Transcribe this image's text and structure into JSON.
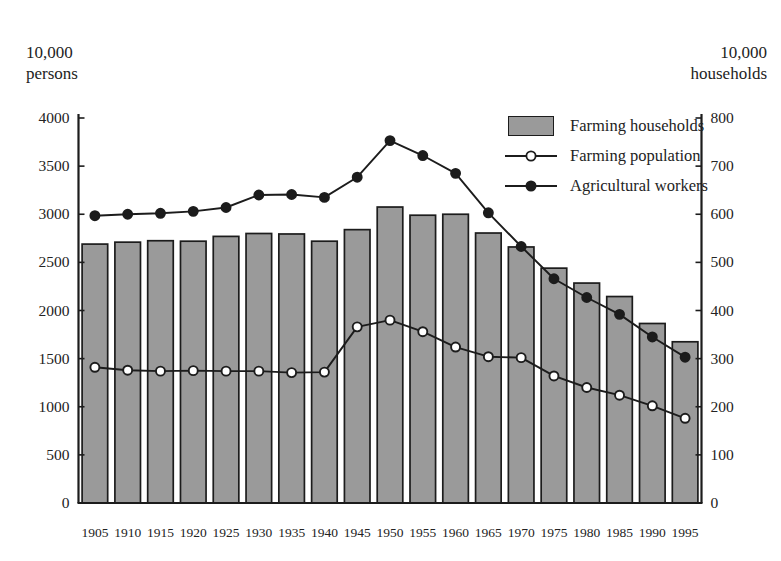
{
  "chart_data": {
    "type": "bar",
    "title": "",
    "subtitle": "",
    "xlabel": "",
    "ylabel": "10,000 persons",
    "y2label": "10,000 households",
    "grid": false,
    "legend_position": "top-right inside plot",
    "categories": [
      "1905",
      "1910",
      "1915",
      "1920",
      "1925",
      "1930",
      "1935",
      "1940",
      "1945",
      "1950",
      "1955",
      "1960",
      "1965",
      "1970",
      "1975",
      "1980",
      "1985",
      "1990",
      "1995"
    ],
    "axes": {
      "left": {
        "label": "10,000 persons",
        "min": 0,
        "max": 4000,
        "step": 500,
        "ticks": [
          "0",
          "500",
          "1000",
          "1500",
          "2000",
          "2500",
          "3000",
          "3500",
          "4000"
        ]
      },
      "right": {
        "label": "10,000 households",
        "min": 0,
        "max": 800,
        "step": 100,
        "ticks": [
          "0",
          "100",
          "200",
          "300",
          "400",
          "500",
          "600",
          "700",
          "800"
        ]
      },
      "x": {
        "ticks": [
          "1905",
          "1910",
          "1915",
          "1920",
          "1925",
          "1930",
          "1935",
          "1940",
          "1945",
          "1950",
          "1955",
          "1960",
          "1965",
          "1970",
          "1975",
          "1980",
          "1985",
          "1990",
          "1995"
        ]
      }
    },
    "series": [
      {
        "name": "Farming households",
        "kind": "bar",
        "axis": "right",
        "color": "#9a9a9a",
        "edge_color": "#1c1c1c",
        "units": "10,000 households",
        "values": [
          538,
          542,
          545,
          544,
          554,
          560,
          559,
          544,
          568,
          615,
          598,
          600,
          561,
          532,
          488,
          457,
          429,
          373,
          335
        ]
      },
      {
        "name": "Farming population",
        "kind": "line",
        "axis": "left",
        "marker": "open-circle",
        "color": "#1c1c1c",
        "units": "10,000 persons",
        "values": [
          1410,
          1380,
          1370,
          1375,
          1370,
          1370,
          1355,
          1360,
          1830,
          1900,
          1780,
          1620,
          1520,
          1510,
          1320,
          1200,
          1120,
          1010,
          880
        ]
      },
      {
        "name": "Agricultural workers",
        "kind": "line",
        "axis": "right",
        "marker": "filled-circle",
        "color": "#1c1c1c",
        "units": "10,000 households",
        "values": [
          597,
          600,
          602,
          606,
          614,
          640,
          641,
          635,
          677,
          753,
          722,
          685,
          603,
          533,
          466,
          427,
          392,
          345,
          303
        ]
      }
    ]
  },
  "legend": {
    "items": [
      {
        "label": "Farming households",
        "key": "swatch"
      },
      {
        "label": "Farming population",
        "key": "open-circle"
      },
      {
        "label": "Agricultural workers",
        "key": "filled-circle"
      }
    ]
  },
  "units": {
    "left": "10,000\npersons",
    "right": "10,000\nhouseholds"
  },
  "colors": {
    "bar_fill": "#9a9a9a",
    "bar_edge": "#1c1c1c",
    "line": "#1c1c1c",
    "axis": "#1c1c1c",
    "text": "#232323",
    "background": "#ffffff"
  }
}
